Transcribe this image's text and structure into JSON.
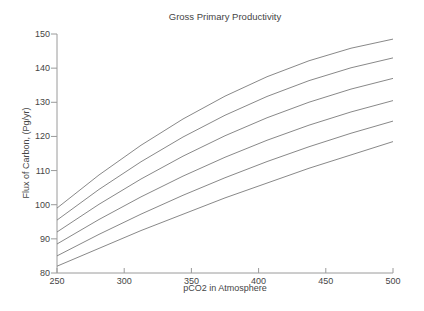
{
  "figure": {
    "background": "#ffffff",
    "curve_color": "#7a7a7a",
    "axis_color": "#9a9a9a",
    "text_color": "#454545"
  },
  "chart_data": {
    "type": "line",
    "title": "Gross Primary Productivity",
    "xlabel": "pCO2 in Atmosphere",
    "ylabel": "Flux of Carbon, (Pg/yr)",
    "xlim": [
      250,
      500
    ],
    "ylim": [
      80,
      150
    ],
    "x_ticks": [
      250,
      300,
      350,
      400,
      450,
      500
    ],
    "y_ticks": [
      80,
      90,
      100,
      110,
      120,
      130,
      140,
      150
    ],
    "grid": false,
    "legend_position": "none",
    "axes_style": "left-and-bottom-only",
    "x": [
      250,
      375,
      500
    ],
    "series": [
      {
        "name": "curve-1",
        "values": [
          99.0,
          131.8,
          148.5
        ]
      },
      {
        "name": "curve-2",
        "values": [
          95.5,
          126.2,
          143.0
        ]
      },
      {
        "name": "curve-3",
        "values": [
          92.0,
          120.2,
          137.0
        ]
      },
      {
        "name": "curve-4",
        "values": [
          88.5,
          113.9,
          130.5
        ]
      },
      {
        "name": "curve-5",
        "values": [
          85.0,
          107.9,
          124.5
        ]
      },
      {
        "name": "curve-6",
        "values": [
          82.0,
          102.0,
          118.5
        ]
      }
    ]
  }
}
